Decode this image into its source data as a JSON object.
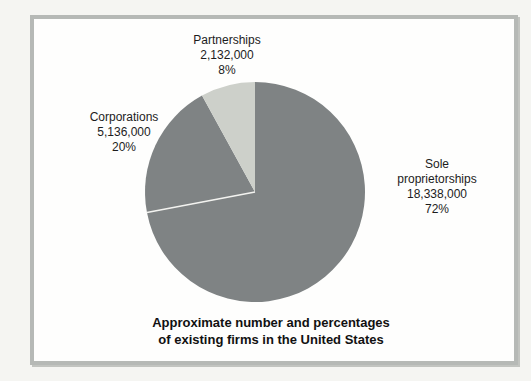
{
  "chart_data": {
    "type": "pie",
    "title": "Approximate number and percentages of existing firms in the United States",
    "caption_lines": [
      "Approximate number and percentages",
      "of existing firms in the United States"
    ],
    "start_position": "12-oclock",
    "direction": "clockwise",
    "slices": [
      {
        "id": "sole-proprietorships",
        "label": "Sole proprietorships",
        "count_display": "18,338,000",
        "value": 18338000,
        "pct": 72,
        "pct_display": "72%",
        "color": "#7f8384"
      },
      {
        "id": "corporations",
        "label": "Corporations",
        "count_display": "5,136,000",
        "value": 5136000,
        "pct": 20,
        "pct_display": "20%",
        "color": "#7f8384"
      },
      {
        "id": "partnerships",
        "label": "Partnerships",
        "count_display": "2,132,000",
        "value": 2132000,
        "pct": 8,
        "pct_display": "8%",
        "color": "#cdd0ca"
      }
    ],
    "divider": {
      "after_slice_index": 0,
      "color": "#f3f3f0",
      "width": 1.5
    },
    "legend": "none",
    "colors": {
      "frame_border": "#b6b9b6",
      "chart_background": "#fefefd",
      "page_background": "#f5f5f2",
      "text": "#1c1c1c"
    }
  }
}
